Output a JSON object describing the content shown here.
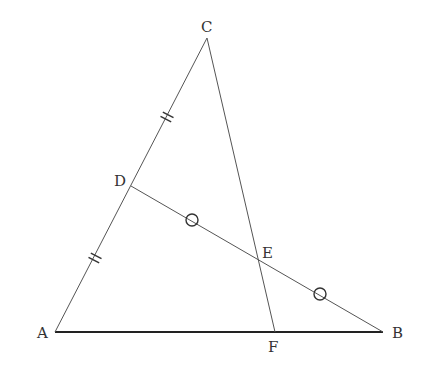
{
  "diagram": {
    "type": "geometry",
    "colors": {
      "line": "#555555",
      "base": "#222222",
      "background": "#ffffff"
    },
    "points": {
      "A": {
        "label": "A",
        "x": 55,
        "y": 332
      },
      "B": {
        "label": "B",
        "x": 383,
        "y": 332
      },
      "C": {
        "label": "C",
        "x": 207,
        "y": 38
      },
      "D": {
        "label": "D",
        "x": 131,
        "y": 186
      },
      "E": {
        "label": "E",
        "x": 258,
        "y": 259
      },
      "F": {
        "label": "F",
        "x": 275,
        "y": 332
      }
    },
    "segments": [
      {
        "from": "A",
        "to": "B",
        "weight": "bold"
      },
      {
        "from": "A",
        "to": "C",
        "weight": "thin"
      },
      {
        "from": "C",
        "to": "F",
        "weight": "thin"
      },
      {
        "from": "D",
        "to": "B",
        "weight": "thin"
      }
    ],
    "marks": {
      "double_ticks": [
        {
          "segment": "DC",
          "x": 167,
          "y": 117
        },
        {
          "segment": "AD",
          "x": 95,
          "y": 258
        }
      ],
      "circles": [
        {
          "segment": "DE",
          "x": 192,
          "y": 220
        },
        {
          "segment": "EB",
          "x": 320,
          "y": 294
        }
      ]
    }
  }
}
